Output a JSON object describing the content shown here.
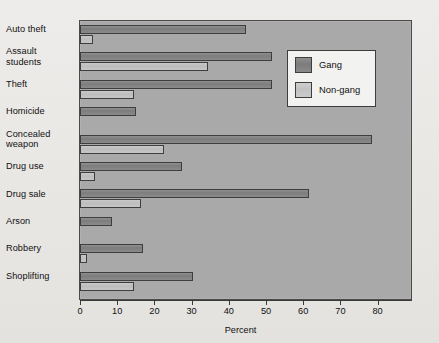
{
  "chart_data": {
    "type": "bar",
    "orientation": "horizontal",
    "title": "",
    "xlabel": "Percent",
    "ylabel": "",
    "xlim": [
      0,
      85
    ],
    "xticks": [
      0,
      10,
      20,
      30,
      40,
      50,
      60,
      70,
      80
    ],
    "xticklabels": [
      "0",
      "10",
      "20",
      "30",
      "40",
      "50",
      "60",
      "70",
      "80"
    ],
    "grid": false,
    "legend_position": "upper right",
    "categories": [
      "Auto theft",
      "Assault students",
      "Theft",
      "Homicide",
      "Concealed weapon",
      "Drug use",
      "Drug sale",
      "Arson",
      "Robbery",
      "Shoplifting"
    ],
    "category_lines": [
      [
        "Auto theft"
      ],
      [
        "Assault",
        "students"
      ],
      [
        "Theft"
      ],
      [
        "Homicide"
      ],
      [
        "Concealed",
        "weapon"
      ],
      [
        "Drug use"
      ],
      [
        "Drug sale"
      ],
      [
        "Arson"
      ],
      [
        "Robbery"
      ],
      [
        "Shoplifting"
      ]
    ],
    "series": [
      {
        "name": "Gang",
        "color": "#838383",
        "values": [
          44.5,
          51.5,
          51.5,
          15.0,
          78.5,
          27.5,
          61.5,
          8.5,
          17.0,
          30.5
        ]
      },
      {
        "name": "Non-gang",
        "color": "#c4c4c4",
        "values": [
          3.5,
          34.5,
          14.5,
          0,
          22.5,
          4.0,
          16.5,
          0,
          2.0,
          14.5
        ]
      }
    ]
  },
  "legend": {
    "items": [
      {
        "label": "Gang",
        "key": "gang"
      },
      {
        "label": "Non-gang",
        "key": "nongang"
      }
    ]
  },
  "axis": {
    "x_title": "Percent"
  },
  "colors": {
    "plot_background": "#a9a9a9",
    "page_background": "#eceae7",
    "frame_border": "#4a4a4a",
    "gang_bar": "#838383",
    "nongang_bar": "#c4c4c4",
    "text": "#101010"
  }
}
